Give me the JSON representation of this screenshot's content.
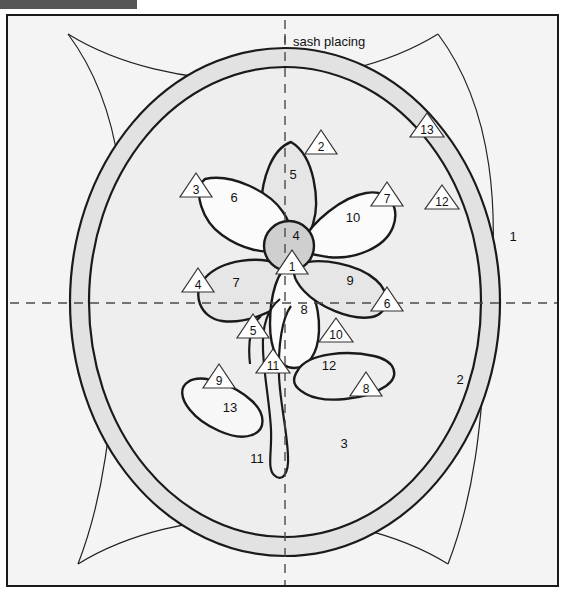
{
  "page": {
    "topbar_present": true
  },
  "colors": {
    "outer_background": "#f0f0f0",
    "region1_fill": "#f4f4f4",
    "ring_band_fill": "#e2e2e2",
    "region3_fill": "#eeeeee",
    "petal_gray_fill": "#e6e6e6",
    "petal_white_fill": "#fbfbfb",
    "center_fill": "#cfcfcf",
    "line_color": "#1a1a1a",
    "dash_color": "#4a4a4a",
    "topbar_color": "#555555"
  },
  "annotations": {
    "sash_placing": "sash placing"
  },
  "region_labels": [
    {
      "id": "region-1",
      "text": "1",
      "x": 505,
      "y": 225
    },
    {
      "id": "region-2",
      "text": "2",
      "x": 452,
      "y": 368
    },
    {
      "id": "region-3",
      "text": "3",
      "x": 336,
      "y": 432
    },
    {
      "id": "petal-5",
      "text": "5",
      "x": 285,
      "y": 163
    },
    {
      "id": "petal-6",
      "text": "6",
      "x": 226,
      "y": 186
    },
    {
      "id": "petal-7",
      "text": "7",
      "x": 228,
      "y": 271
    },
    {
      "id": "petal-8",
      "text": "8",
      "x": 296,
      "y": 298
    },
    {
      "id": "petal-9",
      "text": "9",
      "x": 342,
      "y": 269
    },
    {
      "id": "petal-10",
      "text": "10",
      "x": 345,
      "y": 206
    },
    {
      "id": "center-4",
      "text": "4",
      "x": 288,
      "y": 224
    },
    {
      "id": "leaf-12",
      "text": "12",
      "x": 321,
      "y": 354
    },
    {
      "id": "leaf-13",
      "text": "13",
      "x": 222,
      "y": 396
    },
    {
      "id": "stem-11",
      "text": "11",
      "x": 249,
      "y": 447
    }
  ],
  "callouts": [
    {
      "id": "callout-1",
      "text": "1",
      "x": 284,
      "y": 247
    },
    {
      "id": "callout-2",
      "text": "2",
      "x": 313,
      "y": 127
    },
    {
      "id": "callout-3",
      "text": "3",
      "x": 188,
      "y": 170
    },
    {
      "id": "callout-4",
      "text": "4",
      "x": 190,
      "y": 265
    },
    {
      "id": "callout-5",
      "text": "5",
      "x": 245,
      "y": 311
    },
    {
      "id": "callout-6",
      "text": "6",
      "x": 379,
      "y": 284
    },
    {
      "id": "callout-7",
      "text": "7",
      "x": 379,
      "y": 179
    },
    {
      "id": "callout-8",
      "text": "8",
      "x": 358,
      "y": 369
    },
    {
      "id": "callout-9",
      "text": "9",
      "x": 211,
      "y": 361
    },
    {
      "id": "callout-10",
      "text": "10",
      "x": 328,
      "y": 315
    },
    {
      "id": "callout-11",
      "text": "11",
      "x": 265,
      "y": 346
    },
    {
      "id": "callout-12",
      "text": "12",
      "x": 434,
      "y": 182
    },
    {
      "id": "callout-13",
      "text": "13",
      "x": 419,
      "y": 110
    }
  ]
}
